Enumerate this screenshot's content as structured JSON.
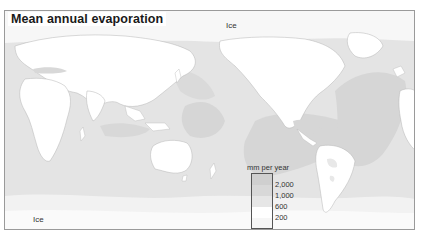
{
  "map": {
    "title": "Mean annual evaporation",
    "labels": {
      "ice_north": "Ice",
      "ice_south": "Ice"
    },
    "projection": "world map centered on Pacific",
    "legend": {
      "title": "mm per year",
      "classes": [
        {
          "range": "> 2,000",
          "color": "#cfcfcf"
        },
        {
          "range": "1,000 – 2,000",
          "color": "#d6d6d6"
        },
        {
          "range": "600 – 1,000",
          "color": "#e4e4e4"
        },
        {
          "range": "200 – 600",
          "color": "#ffffff"
        },
        {
          "range": "< 200",
          "color": "#f4f4f4"
        }
      ],
      "breaks": [
        "2,000",
        "1,000",
        "600",
        "200"
      ]
    },
    "colors": {
      "frame_border": "#9a9a9a",
      "ocean_base": "#e4e4e4",
      "ocean_high": "#d6d6d6",
      "ocean_highest": "#cfcfcf",
      "land": "#ffffff",
      "land_mid": "#e8e8e8",
      "polar": "#f7f7f7",
      "coastline": "#b0b0b0"
    }
  }
}
